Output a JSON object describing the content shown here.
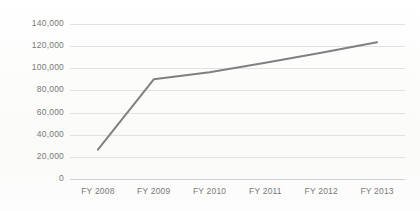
{
  "chart_data": {
    "type": "line",
    "title": "",
    "subtitle": "",
    "xlabel": "",
    "ylabel": "",
    "categories": [
      "FY 2008",
      "FY 2009",
      "FY 2010",
      "FY 2011",
      "FY 2012",
      "FY 2013"
    ],
    "series": [
      {
        "name": "Series 1",
        "values": [
          26500,
          90000,
          96500,
          105000,
          114000,
          123500
        ],
        "color": "#808080"
      }
    ],
    "ylim": [
      0,
      140000
    ],
    "ytick_values": [
      0,
      20000,
      40000,
      60000,
      80000,
      100000,
      120000,
      140000
    ],
    "ytick_labels": [
      "0",
      "20,000",
      "40,000",
      "60,000",
      "80,000",
      "100,000",
      "120,000",
      "140,000"
    ],
    "grid": true,
    "grid_axis": "y",
    "legend": false,
    "legend_position": "none",
    "markers": false,
    "line_width": 2,
    "colors": {
      "series": "#808080",
      "gridline": "#e2e2e2",
      "axis": "#cfcfcf",
      "tick_text": "#7a7a7a",
      "background": "#fdfdfd"
    }
  }
}
